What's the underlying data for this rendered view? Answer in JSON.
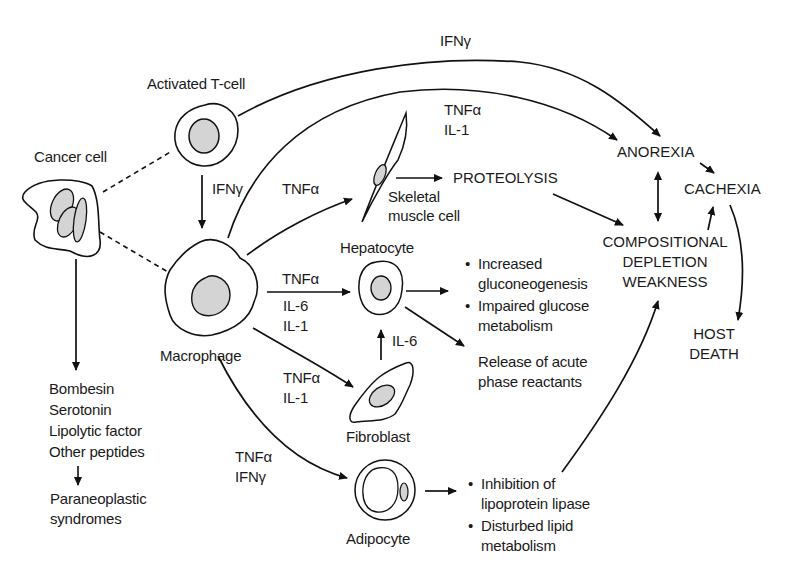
{
  "diagram": {
    "type": "pathophysiology-flow",
    "cells": {
      "activated_t_cell": "Activated T-cell",
      "cancer_cell": "Cancer cell",
      "macrophage": "Macrophage",
      "skeletal_muscle_cell": "Skeletal\nmuscle cell",
      "hepatocyte": "Hepatocyte",
      "fibroblast": "Fibroblast",
      "adipocyte": "Adipocyte"
    },
    "mediators": {
      "tcell_to_anorexia": "IFNγ",
      "tcell_to_macrophage": "IFNγ",
      "macrophage_to_anorexia": "TNFα\nIL-1",
      "macrophage_to_muscle": "TNFα",
      "macrophage_to_hepatocyte": "TNFα",
      "macrophage_to_hepatocyte_extra": "IL-6\nIL-1",
      "fibroblast_to_hepatocyte": "IL-6",
      "macrophage_to_fibroblast": "TNFα\nIL-1",
      "macrophage_to_adipocyte": "TNFα\nIFNγ"
    },
    "outcomes": {
      "proteolysis": "PROTEOLYSIS",
      "anorexia": "ANOREXIA",
      "cachexia": "CACHEXIA",
      "compositional": "COMPOSITIONAL\nDEPLETION\nWEAKNESS",
      "host_death": "HOST\nDEATH",
      "hepatic_effects": [
        "Increased\ngluconeogenesis",
        "Impaired glucose\nmetabolism"
      ],
      "acute_phase": "Release of acute\nphase reactants",
      "adipocyte_effects": [
        "Inhibition of\nlipoprotein lipase",
        "Disturbed lipid\nmetabolism"
      ],
      "cancer_products": "Bombesin\nSerotonin\nLipolytic factor\nOther peptides",
      "paraneoplastic": "Paraneoplastic\nsyndromes"
    },
    "colors": {
      "line": "#111111",
      "nucleus_fill": "#d4d4d4",
      "background": "#ffffff"
    }
  }
}
